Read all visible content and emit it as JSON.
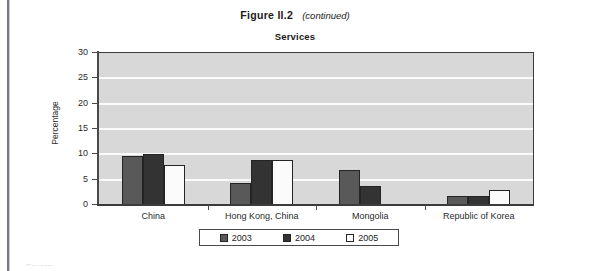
{
  "figure": {
    "label": "Figure II.2",
    "continued": "(continued)"
  },
  "chart_data": {
    "type": "bar",
    "title": "Services",
    "xlabel": "",
    "ylabel": "Percentage",
    "ylim": [
      0,
      30
    ],
    "yticks": [
      0,
      5,
      10,
      15,
      20,
      25,
      30
    ],
    "ytick_labels": [
      "0",
      "5",
      "10",
      "15",
      "20",
      "25",
      "30"
    ],
    "grid": true,
    "legend_position": "bottom",
    "categories": [
      "China",
      "Hong Kong, China",
      "Mongolia",
      "Republic of Korea"
    ],
    "series": [
      {
        "name": "2003",
        "color": "#595959",
        "values": [
          9.6,
          4.4,
          7.0,
          1.8
        ]
      },
      {
        "name": "2004",
        "color": "#333333",
        "values": [
          10.0,
          8.8,
          3.7,
          1.7
        ]
      },
      {
        "name": "2005",
        "color": "#ffffff",
        "values": [
          7.9,
          8.8,
          null,
          2.9
        ]
      }
    ]
  },
  "legend": {
    "items": [
      {
        "label": "2003",
        "swatch": "s2003"
      },
      {
        "label": "2004",
        "swatch": "s2004"
      },
      {
        "label": "2005",
        "swatch": "s2005"
      }
    ]
  },
  "source_note": "Source:"
}
